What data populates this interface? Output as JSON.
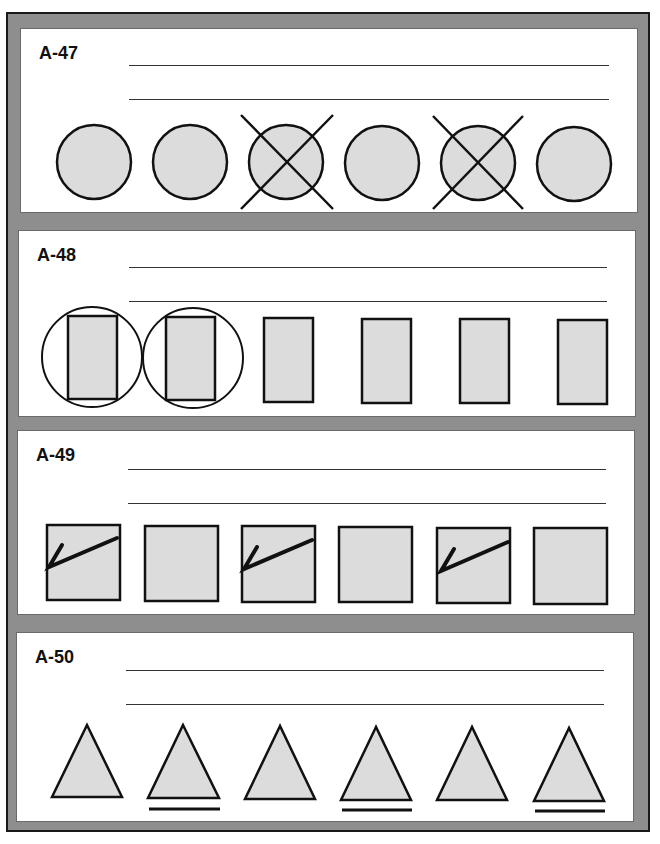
{
  "worksheet": {
    "panels": [
      {
        "id": "A-47",
        "label": "A-47",
        "shape": "circle",
        "items": [
          {
            "marked": false,
            "mark": "none"
          },
          {
            "marked": false,
            "mark": "none"
          },
          {
            "marked": true,
            "mark": "x-cross"
          },
          {
            "marked": false,
            "mark": "none"
          },
          {
            "marked": true,
            "mark": "x-cross"
          },
          {
            "marked": false,
            "mark": "none"
          }
        ]
      },
      {
        "id": "A-48",
        "label": "A-48",
        "shape": "rectangle",
        "items": [
          {
            "marked": true,
            "mark": "circled"
          },
          {
            "marked": true,
            "mark": "circled"
          },
          {
            "marked": false,
            "mark": "none"
          },
          {
            "marked": false,
            "mark": "none"
          },
          {
            "marked": false,
            "mark": "none"
          },
          {
            "marked": false,
            "mark": "none"
          }
        ]
      },
      {
        "id": "A-49",
        "label": "A-49",
        "shape": "square",
        "items": [
          {
            "marked": true,
            "mark": "check"
          },
          {
            "marked": false,
            "mark": "none"
          },
          {
            "marked": true,
            "mark": "check"
          },
          {
            "marked": false,
            "mark": "none"
          },
          {
            "marked": true,
            "mark": "check"
          },
          {
            "marked": false,
            "mark": "none"
          }
        ]
      },
      {
        "id": "A-50",
        "label": "A-50",
        "shape": "triangle",
        "items": [
          {
            "marked": false,
            "mark": "none"
          },
          {
            "marked": true,
            "mark": "underline"
          },
          {
            "marked": false,
            "mark": "none"
          },
          {
            "marked": true,
            "mark": "underline"
          },
          {
            "marked": false,
            "mark": "none"
          },
          {
            "marked": true,
            "mark": "underline"
          }
        ]
      }
    ],
    "colors": {
      "frame": "#8e8e8e",
      "shape_fill": "#dcdcdc",
      "stroke": "#111111",
      "panel_bg": "#ffffff"
    }
  }
}
